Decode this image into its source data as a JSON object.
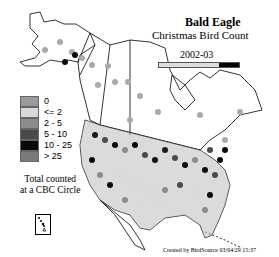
{
  "title": "Bald Eagle",
  "subtitle": "Christmas Bird Count",
  "season": "2002-03",
  "legend": {
    "items": [
      {
        "label": "0",
        "color": "#9a9a9a"
      },
      {
        "label": "<= 2",
        "color": "#d9d9d9"
      },
      {
        "label": "2 - 5",
        "color": "#8c8c8c"
      },
      {
        "label": "5 - 10",
        "color": "#4a4a4a"
      },
      {
        "label": "10 - 25",
        "color": "#0a0a0a"
      },
      {
        "label": "> 25",
        "color": "#7a7a7a"
      }
    ],
    "note_line1": "Total counted",
    "note_line2": "at a CBC Circle"
  },
  "credit": "Created by BirdSource  03/04/29 15:37",
  "colors": {
    "background": "#ffffff",
    "border": "#000000",
    "timeline_fill": "#000000"
  }
}
